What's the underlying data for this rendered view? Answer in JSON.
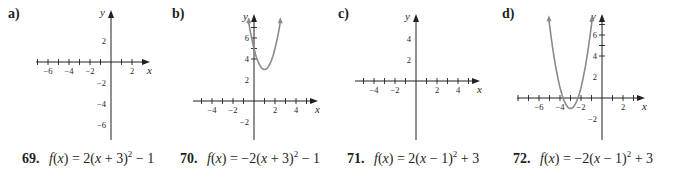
{
  "chart_data": [
    {
      "type": "line",
      "panel": "a)",
      "title": "",
      "xlabel": "x",
      "ylabel": "y",
      "x_ticks_labeled": [
        -6,
        -4,
        -2,
        2
      ],
      "y_ticks_labeled": [
        2,
        -2,
        -4,
        -6
      ],
      "xlim": [
        -7,
        3
      ],
      "ylim": [
        -7.5,
        3.5
      ],
      "curve": "downward parabola",
      "vertex": [
        -3,
        -1
      ],
      "series": [
        {
          "name": "a",
          "x": [
            -5,
            -4,
            -3,
            -2,
            -1
          ],
          "y": [
            -9,
            -3,
            -1,
            -3,
            -9
          ]
        }
      ]
    },
    {
      "type": "line",
      "panel": "b)",
      "title": "",
      "xlabel": "x",
      "ylabel": "y",
      "x_ticks_labeled": [
        -4,
        -2,
        2,
        4
      ],
      "y_ticks_labeled": [
        6,
        4,
        2,
        -2
      ],
      "xlim": [
        -5,
        6
      ],
      "ylim": [
        -3,
        7.5
      ],
      "curve": "upward parabola",
      "vertex": [
        1,
        3
      ],
      "series": [
        {
          "name": "b",
          "x": [
            -0.5,
            0,
            1,
            2,
            2.5
          ],
          "y": [
            7.5,
            5,
            3,
            5,
            7.5
          ]
        }
      ]
    },
    {
      "type": "line",
      "panel": "c)",
      "title": "",
      "xlabel": "x",
      "ylabel": "y",
      "x_ticks_labeled": [
        -4,
        -2,
        2,
        4
      ],
      "y_ticks_labeled": [
        4,
        2
      ],
      "xlim": [
        -5,
        6
      ],
      "ylim": [
        -5.5,
        5
      ],
      "curve": "downward parabola",
      "vertex": [
        1,
        3
      ],
      "series": [
        {
          "name": "c",
          "x": [
            -1,
            0,
            1,
            2,
            3
          ],
          "y": [
            -5,
            1,
            3,
            1,
            -5
          ]
        }
      ]
    },
    {
      "type": "line",
      "panel": "d)",
      "title": "",
      "xlabel": "x",
      "ylabel": "y",
      "x_ticks_labeled": [
        -6,
        -4,
        -2,
        2
      ],
      "y_ticks_labeled": [
        6,
        4,
        2,
        -2
      ],
      "xlim": [
        -7,
        3
      ],
      "ylim": [
        -3,
        7.5
      ],
      "curve": "upward parabola",
      "vertex": [
        -3,
        -1
      ],
      "series": [
        {
          "name": "d",
          "x": [
            -5,
            -4,
            -3,
            -2,
            -1
          ],
          "y": [
            7,
            1,
            -1,
            1,
            7
          ]
        }
      ]
    }
  ],
  "panels": {
    "a": {
      "label": "a)"
    },
    "b": {
      "label": "b)"
    },
    "c": {
      "label": "c)"
    },
    "d": {
      "label": "d)"
    }
  },
  "equations": [
    {
      "number": "69.",
      "lhs": "f(x)",
      "text": "f(x) = 2(x + 3)² − 1",
      "pre": "= 2(",
      "x": "x",
      "mid": " + 3)",
      "exp": "2",
      "post": " − 1"
    },
    {
      "number": "70.",
      "lhs": "f(x)",
      "text": "f(x) = −2(x + 3)² − 1",
      "pre": "= −2(",
      "x": "x",
      "mid": " + 3)",
      "exp": "2",
      "post": " − 1"
    },
    {
      "number": "71.",
      "lhs": "f(x)",
      "text": "f(x) = 2(x − 1)² + 3",
      "pre": "= 2(",
      "x": "x",
      "mid": " − 1)",
      "exp": "2",
      "post": " + 3"
    },
    {
      "number": "72.",
      "lhs": "f(x)",
      "text": "f(x) = −2(x − 1)² + 3",
      "pre": "= −2(",
      "x": "x",
      "mid": " − 1)",
      "exp": "2",
      "post": " + 3"
    }
  ],
  "colors": {
    "axis": "#231f20",
    "curve": "#8a8a8a",
    "background": "#ffffff"
  }
}
